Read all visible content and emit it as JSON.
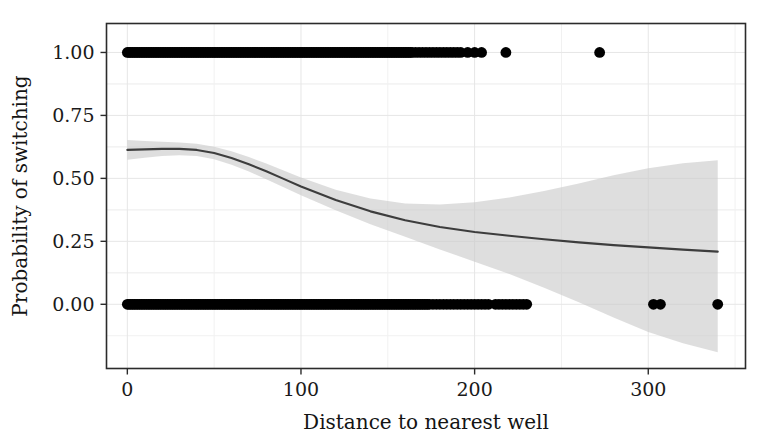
{
  "chart_data": {
    "type": "scatter",
    "title": "",
    "subtitle": "",
    "xlabel": "Distance to nearest well",
    "ylabel": "Probability of switching",
    "xlim": [
      -12,
      356
    ],
    "ylim": [
      -0.255,
      1.115
    ],
    "xticks": [
      0,
      100,
      200,
      300
    ],
    "xtick_labels": [
      "0",
      "100",
      "200",
      "300"
    ],
    "yticks": [
      0.0,
      0.25,
      0.5,
      0.75,
      1.0
    ],
    "ytick_labels": [
      "0.00",
      "0.25",
      "0.50",
      "0.75",
      "1.00"
    ],
    "grid": true,
    "grid_minor": true,
    "legend": "none",
    "series": [
      {
        "name": "observations",
        "type": "scatter",
        "marker": "filled-circle",
        "color": "#000000",
        "note": "Binary outcome jittered onto y = 0 and y = 1 rows; heavy overplotting below ~170 m.",
        "y1_x_values": [
          0,
          1,
          2,
          3,
          4,
          5,
          6,
          7,
          8,
          9,
          10,
          11,
          12,
          13,
          14,
          15,
          16,
          17,
          18,
          19,
          20,
          21,
          22,
          23,
          24,
          25,
          26,
          27,
          28,
          29,
          30,
          31,
          32,
          33,
          34,
          35,
          36,
          37,
          38,
          39,
          40,
          41,
          42,
          43,
          44,
          45,
          46,
          47,
          48,
          49,
          50,
          51,
          52,
          53,
          54,
          55,
          56,
          57,
          58,
          59,
          60,
          61,
          62,
          63,
          64,
          65,
          66,
          67,
          68,
          69,
          70,
          71,
          72,
          73,
          74,
          75,
          76,
          77,
          78,
          79,
          80,
          81,
          82,
          83,
          84,
          85,
          86,
          87,
          88,
          89,
          90,
          91,
          92,
          93,
          94,
          95,
          96,
          97,
          98,
          99,
          100,
          101,
          102,
          103,
          104,
          105,
          106,
          107,
          108,
          109,
          110,
          111,
          112,
          113,
          114,
          115,
          116,
          117,
          118,
          119,
          120,
          121,
          122,
          123,
          124,
          125,
          126,
          127,
          128,
          129,
          130,
          131,
          132,
          133,
          134,
          135,
          136,
          137,
          138,
          139,
          140,
          141,
          142,
          143,
          144,
          145,
          146,
          147,
          148,
          149,
          150,
          151,
          152,
          153,
          154,
          155,
          156,
          157,
          158,
          159,
          160,
          161,
          162,
          163,
          164,
          166,
          168,
          170,
          172,
          174,
          176,
          178,
          180,
          182,
          184,
          186,
          188,
          190,
          192,
          196,
          200,
          204,
          218,
          272
        ],
        "y0_x_values": [
          0,
          1,
          2,
          3,
          4,
          5,
          6,
          7,
          8,
          9,
          10,
          11,
          12,
          13,
          14,
          15,
          16,
          17,
          18,
          19,
          20,
          21,
          22,
          23,
          24,
          25,
          26,
          27,
          28,
          29,
          30,
          31,
          32,
          33,
          34,
          35,
          36,
          37,
          38,
          39,
          40,
          41,
          42,
          43,
          44,
          45,
          46,
          47,
          48,
          49,
          50,
          51,
          52,
          53,
          54,
          55,
          56,
          57,
          58,
          59,
          60,
          61,
          62,
          63,
          64,
          65,
          66,
          67,
          68,
          69,
          70,
          71,
          72,
          73,
          74,
          75,
          76,
          77,
          78,
          79,
          80,
          81,
          82,
          83,
          84,
          85,
          86,
          87,
          88,
          89,
          90,
          91,
          92,
          93,
          94,
          95,
          96,
          97,
          98,
          99,
          100,
          101,
          102,
          103,
          104,
          105,
          106,
          107,
          108,
          109,
          110,
          111,
          112,
          113,
          114,
          115,
          116,
          117,
          118,
          119,
          120,
          121,
          122,
          123,
          124,
          125,
          126,
          127,
          128,
          129,
          130,
          131,
          132,
          133,
          134,
          135,
          136,
          137,
          138,
          139,
          140,
          141,
          142,
          143,
          144,
          145,
          146,
          147,
          148,
          149,
          150,
          151,
          152,
          153,
          154,
          155,
          156,
          157,
          158,
          159,
          160,
          161,
          162,
          163,
          164,
          165,
          166,
          167,
          168,
          169,
          170,
          171,
          172,
          173,
          174,
          176,
          178,
          180,
          182,
          184,
          186,
          188,
          190,
          192,
          194,
          196,
          198,
          200,
          202,
          204,
          206,
          208,
          212,
          214,
          216,
          218,
          220,
          222,
          224,
          226,
          228,
          230,
          303,
          307,
          340
        ]
      },
      {
        "name": "fitted-probability",
        "type": "line",
        "color": "#3d3d3d",
        "note": "Smoothed (GAM / loess) fit of switching probability vs distance.",
        "x": [
          0,
          10,
          20,
          30,
          40,
          50,
          60,
          70,
          80,
          90,
          100,
          120,
          140,
          160,
          180,
          200,
          220,
          240,
          260,
          280,
          300,
          320,
          340
        ],
        "y": [
          0.613,
          0.615,
          0.617,
          0.617,
          0.613,
          0.601,
          0.581,
          0.556,
          0.528,
          0.498,
          0.468,
          0.414,
          0.369,
          0.334,
          0.307,
          0.287,
          0.272,
          0.258,
          0.246,
          0.235,
          0.226,
          0.217,
          0.209
        ]
      },
      {
        "name": "confidence-band",
        "type": "area",
        "color": "#c9c9c9",
        "note": "Pointwise confidence interval; widens sharply beyond 200 m where data are sparse.",
        "x": [
          0,
          10,
          20,
          30,
          40,
          50,
          60,
          70,
          80,
          90,
          100,
          120,
          140,
          160,
          180,
          200,
          220,
          240,
          260,
          280,
          300,
          320,
          340
        ],
        "upper": [
          0.652,
          0.648,
          0.645,
          0.642,
          0.637,
          0.626,
          0.608,
          0.585,
          0.559,
          0.531,
          0.503,
          0.455,
          0.42,
          0.4,
          0.396,
          0.405,
          0.424,
          0.45,
          0.48,
          0.512,
          0.54,
          0.56,
          0.572
        ],
        "lower": [
          0.574,
          0.582,
          0.589,
          0.592,
          0.589,
          0.576,
          0.554,
          0.527,
          0.497,
          0.465,
          0.433,
          0.373,
          0.318,
          0.268,
          0.218,
          0.169,
          0.12,
          0.066,
          0.008,
          -0.052,
          -0.11,
          -0.155,
          -0.19
        ]
      }
    ]
  },
  "axes": {
    "x_title": "Distance to nearest well",
    "y_title": "Probability of switching",
    "x_tick_labels": [
      "0",
      "100",
      "200",
      "300"
    ],
    "y_tick_labels": [
      "1.00",
      "0.75",
      "0.50",
      "0.25",
      "0.00"
    ]
  },
  "colors": {
    "point": "#000000",
    "line": "#3d3d3d",
    "band": "#c9c9c9",
    "grid": "#e6e6e6",
    "frame": "#2b2b2b",
    "background": "#ffffff"
  }
}
